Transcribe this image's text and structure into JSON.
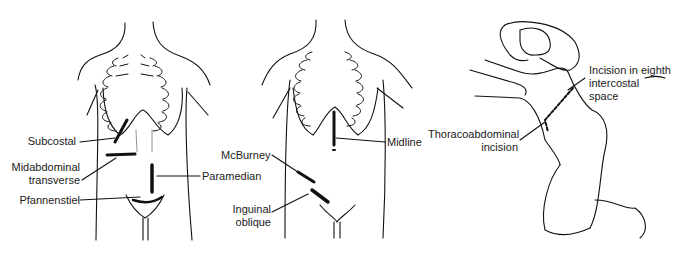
{
  "figure": {
    "panels": [
      {
        "id": "left-torso",
        "labels": {
          "subcostal": "Subcostal",
          "midabdominal_1": "Midabdominal",
          "midabdominal_2": "transverse",
          "paramedian": "Paramedian",
          "pfannenstiel": "Pfannenstiel"
        }
      },
      {
        "id": "middle-torso",
        "labels": {
          "midline": "Midline",
          "mcburney": "McBurney",
          "inguinal_1": "Inguinal",
          "inguinal_2": "oblique"
        }
      },
      {
        "id": "lateral-position",
        "labels": {
          "thoraco_1": "Thoracoabdominal",
          "thoraco_2": "incision",
          "eighth_1": "Incision in eighth",
          "eighth_2": "intercostal",
          "eighth_3": "space"
        }
      }
    ]
  }
}
